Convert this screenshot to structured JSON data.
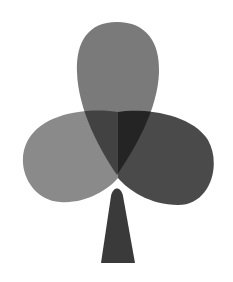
{
  "figure": {
    "style": "grayscale overlapping lobes",
    "colors": {
      "background": "#ffffff",
      "top_lobe": "#7a7a7a",
      "left_lobe": "#8a8a8a",
      "right_lobe": "#4a4a4a",
      "stem": "#3a3a3a"
    }
  }
}
